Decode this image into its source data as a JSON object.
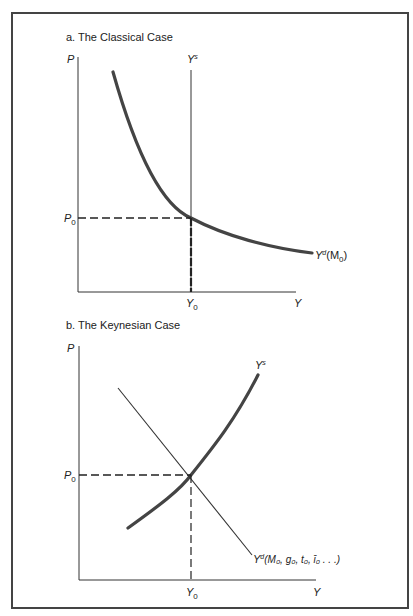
{
  "figure": {
    "border_color": "#444444",
    "curve_color": "#444444",
    "panels": [
      {
        "id": "a",
        "title": "a.  The Classical Case",
        "y_axis_label": "P",
        "x_axis_label": "Y",
        "equilibrium_price_label": "P",
        "equilibrium_price_sub": "0",
        "equilibrium_output_label": "Y",
        "equilibrium_output_sub": "0",
        "supply_label": "Y",
        "supply_sup": "s",
        "demand_label": "Y",
        "demand_sup": "d",
        "demand_args": "(M",
        "demand_args_sub": "0",
        "demand_args_close": ")"
      },
      {
        "id": "b",
        "title": "b.  The Keynesian Case",
        "y_axis_label": "P",
        "x_axis_label": "Y",
        "equilibrium_price_label": "P",
        "equilibrium_price_sub": "0",
        "equilibrium_output_label": "Y",
        "equilibrium_output_sub": "0",
        "supply_label": "Y",
        "supply_sup": "s",
        "demand_label": "Y",
        "demand_sup": "d",
        "demand_args": "(M₀, g₀, t₀, ī₀ . . .)"
      }
    ]
  }
}
